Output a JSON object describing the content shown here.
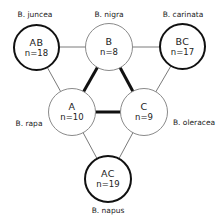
{
  "diagram": {
    "species_labels": {
      "juncea": "B. juncea",
      "nigra": "B. nigra",
      "carinata": "B. carinata",
      "rapa": "B. rapa",
      "oleracea": "B. oleracea",
      "napus": "B. napus"
    },
    "nodes": {
      "AB": {
        "genome": "AB",
        "chromosomes": "n=18",
        "species": "B. juncea",
        "type": "amphidiploid"
      },
      "B": {
        "genome": "B",
        "chromosomes": "n=8",
        "species": "B. nigra",
        "type": "diploid"
      },
      "BC": {
        "genome": "BC",
        "chromosomes": "n=17",
        "species": "B. carinata",
        "type": "amphidiploid"
      },
      "A": {
        "genome": "A",
        "chromosomes": "n=10",
        "species": "B. rapa",
        "type": "diploid"
      },
      "C": {
        "genome": "C",
        "chromosomes": "n=9",
        "species": "B. oleracea",
        "type": "diploid"
      },
      "AC": {
        "genome": "AC",
        "chromosomes": "n=19",
        "species": "B. napus",
        "type": "amphidiploid"
      }
    },
    "edges": [
      {
        "from": "A",
        "to": "B",
        "style": "thick"
      },
      {
        "from": "B",
        "to": "C",
        "style": "thick"
      },
      {
        "from": "A",
        "to": "C",
        "style": "thick"
      },
      {
        "from": "AB",
        "to": "B",
        "style": "thin"
      },
      {
        "from": "AB",
        "to": "A",
        "style": "thin"
      },
      {
        "from": "BC",
        "to": "B",
        "style": "thin"
      },
      {
        "from": "BC",
        "to": "C",
        "style": "thin"
      },
      {
        "from": "AC",
        "to": "A",
        "style": "thin"
      },
      {
        "from": "AC",
        "to": "C",
        "style": "thin"
      }
    ],
    "colors": {
      "thick_line": "#111111",
      "thin_line": "#7a7a7a",
      "diploid_border": "#8a8a8a",
      "amphidiploid_border": "#111111"
    }
  }
}
